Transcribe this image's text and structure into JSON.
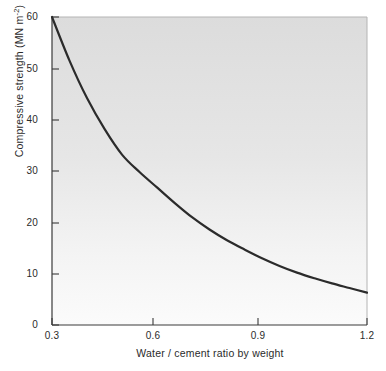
{
  "chart_data": {
    "type": "line",
    "title": "",
    "xlabel": "Water / cement ratio by weight",
    "ylabel_text": "Compressive strength (MN m",
    "ylabel_sup": "-2",
    "ylabel_tail": ")",
    "ylabel_full": "Compressive strength (MN m-2)",
    "xlim": [
      0.3,
      1.2
    ],
    "ylim": [
      0,
      60
    ],
    "xticks": [
      0.3,
      0.6,
      0.9,
      1.2
    ],
    "xtick_labels": [
      "0.3",
      "0.6",
      "0.9",
      "1.2"
    ],
    "yticks": [
      0,
      10,
      20,
      30,
      40,
      50,
      60
    ],
    "ytick_labels": [
      "0",
      "10",
      "20",
      "30",
      "40",
      "50",
      "60"
    ],
    "grid": false,
    "legend": false,
    "series": [
      {
        "name": "Compressive strength",
        "color": "#2b2b2b",
        "linewidth": 2.2,
        "x": [
          0.3,
          0.35,
          0.4,
          0.45,
          0.5,
          0.55,
          0.6,
          0.65,
          0.7,
          0.75,
          0.8,
          0.85,
          0.9,
          0.95,
          1.0,
          1.05,
          1.1,
          1.15,
          1.2
        ],
        "y": [
          60.0,
          51.5,
          44.2,
          38.2,
          33.2,
          29.8,
          26.8,
          23.8,
          21.0,
          18.6,
          16.5,
          14.7,
          13.0,
          11.5,
          10.2,
          9.1,
          8.1,
          7.2,
          6.3
        ]
      }
    ],
    "plot_background": {
      "type": "vertical-gradient",
      "top_color": "#dcdcdc",
      "bottom_color": "#fafafa"
    },
    "axis_color": "#3a3a3a",
    "text_color": "#2b2b2b"
  },
  "axes": {
    "x_tick_positions_px": [
      52,
      153,
      258,
      367
    ],
    "y_tick_positions_px": [
      325,
      274,
      223,
      171,
      120,
      69,
      17
    ],
    "plot_rect_px": {
      "left": 52,
      "top": 17,
      "right": 367,
      "bottom": 325
    }
  }
}
